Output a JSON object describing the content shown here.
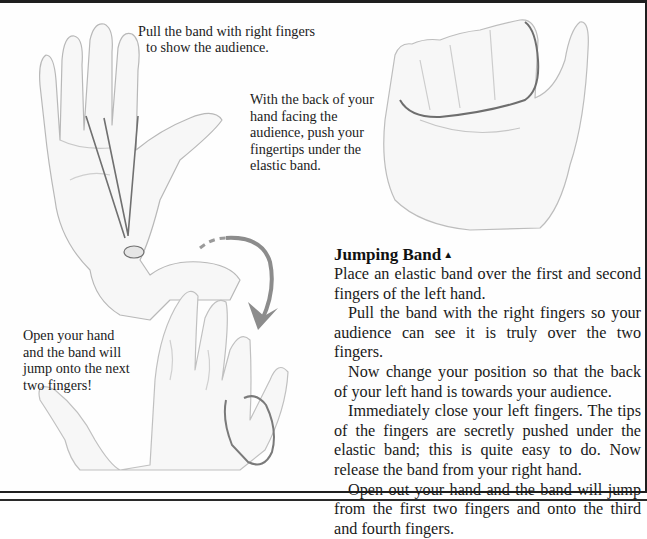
{
  "captions": {
    "pull_band": "Pull the band with right fingers",
    "pull_band_line2": "to show the audience.",
    "back_of_hand": "With the back of your\nhand facing the\naudience, push your\nfingertips under the\nelastic band.",
    "open_hand": "Open your hand\nand the band will\njump onto the next\ntwo fingers!"
  },
  "article": {
    "title": "Jumping Band",
    "title_marker": "▲",
    "paragraphs": [
      "Place an elastic band over the first and second fingers of the left hand.",
      "Pull the band with the right fingers so your audience can see it is truly over the two fingers.",
      "Now change your position so that the back of your left hand is towards your audience.",
      "Immediately close your left fingers. The tips of the fingers are secretly pushed under the elastic band; this is quite easy to do. Now release the band from your right hand.",
      "Open out your hand and the band will jump from the first two fingers and onto the third and fourth fingers."
    ]
  },
  "illustrations": {
    "hand_pull": "left-hand-palm-with-band-pulled",
    "hand_fist": "closed-fist-with-band",
    "hand_open": "open-hand-band-jumped",
    "arrow": "curved-arrow"
  },
  "colors": {
    "rule": "#1e1e1e",
    "sketch": "#9a9a9a",
    "band": "#6e6e6e",
    "arrow": "#8c8c8c"
  }
}
